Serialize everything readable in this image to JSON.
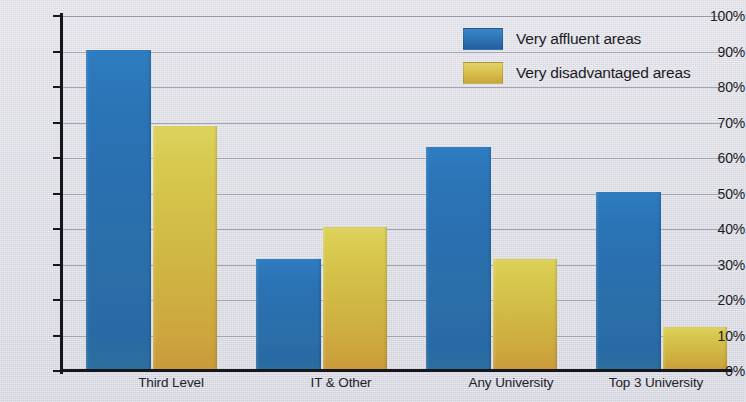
{
  "chart_data": {
    "type": "bar",
    "title": "",
    "subtitle": "",
    "xlabel": "",
    "ylabel": "",
    "ylim": [
      0,
      100
    ],
    "y_unit": "%",
    "grid": true,
    "legend_position": "top-right",
    "categories": [
      "Third Level",
      "IT & Other",
      "Any University",
      "Top 3 University"
    ],
    "ytick_labels": [
      "100%",
      "90%",
      "80%",
      "70%",
      "60%",
      "50%",
      "40%",
      "30%",
      "20%",
      "10%",
      "0%"
    ],
    "ytick_values": [
      100,
      90,
      80,
      70,
      60,
      50,
      40,
      30,
      20,
      10,
      0
    ],
    "series": [
      {
        "name": "Very affluent areas",
        "color": "#2b72b4",
        "values": [
          90.5,
          31.5,
          63.0,
          50.5
        ]
      },
      {
        "name": "Very disadvantaged areas",
        "color": "#d2bd46",
        "values": [
          69.0,
          40.5,
          31.5,
          12.5
        ]
      }
    ]
  },
  "colors": {
    "background": "#dcdce4",
    "axis": "#16161c",
    "gridline": "#9a9aa8",
    "series_affluent": "#2b72b4",
    "series_disadvantaged": "#d2bd46",
    "text": "#1b1b22"
  }
}
